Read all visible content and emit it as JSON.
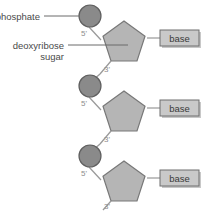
{
  "figure": {
    "background_color": "#ffffff",
    "width": 207,
    "height": 211
  },
  "colors": {
    "phosphate_fill": "#8a8a8a",
    "phosphate_stroke": "#5f5f5f",
    "sugar_fill": "#b5b5b5",
    "sugar_stroke": "#787878",
    "base_fill": "#c9c9c9",
    "base_stroke": "#6e6e6e",
    "base_shadow": "#9a9a9a",
    "bond_stroke": "#9a9a9a",
    "leader_stroke": "#6b6b6b",
    "callout_text": "#4a4a4a",
    "prime_text": "#8d8d8d",
    "base_text": "#3a3a3a"
  },
  "callouts": [
    {
      "id": "phosphate",
      "label": "phosphate",
      "text_x": 38,
      "text_y": 19,
      "anchor": "end",
      "line": {
        "x1": 43,
        "y1": 16,
        "x2": 78,
        "y2": 16
      }
    },
    {
      "id": "deoxyribose-sugar",
      "label_line1": "deoxyribose",
      "label_line2": "sugar",
      "text_x": 62,
      "text_y1": 46,
      "text_y2": 57,
      "anchor": "end",
      "line": {
        "x1": 67,
        "y1": 45,
        "x2": 127,
        "y2": 45
      }
    }
  ],
  "units": [
    {
      "id": "nucleotide-1",
      "phosphate": {
        "cx": 90,
        "cy": 16,
        "r": 11
      },
      "bond_to_sugar": {
        "x1": 90,
        "y1": 27,
        "x2": 99,
        "y2": 37
      },
      "sugar": {
        "cx": 124,
        "cy": 44,
        "r": 23,
        "rotation": 0
      },
      "label_5prime": {
        "text": "5'",
        "x": 84,
        "y": 35
      },
      "label_3prime": {
        "text": "3'",
        "x": 106,
        "y": 72
      },
      "bond_3prime": {
        "x1": 111,
        "y1": 64,
        "x2": 101,
        "y2": 74
      },
      "base": {
        "label": "base",
        "x": 160,
        "y": 30,
        "width": 39,
        "height": 16
      },
      "base_link": {
        "x1": 147,
        "y1": 38,
        "x2": 160,
        "y2": 38
      }
    },
    {
      "id": "nucleotide-2",
      "phosphate": {
        "cx": 90,
        "cy": 86,
        "r": 11
      },
      "bond_to_sugar": {
        "x1": 90,
        "y1": 97,
        "x2": 99,
        "y2": 107
      },
      "sugar": {
        "cx": 124,
        "cy": 114,
        "r": 23,
        "rotation": 0
      },
      "label_5prime": {
        "text": "5'",
        "x": 84,
        "y": 105
      },
      "label_3prime": {
        "text": "3'",
        "x": 106,
        "y": 142
      },
      "bond_3prime": {
        "x1": 111,
        "y1": 134,
        "x2": 101,
        "y2": 144
      },
      "base": {
        "label": "base",
        "x": 160,
        "y": 100,
        "width": 39,
        "height": 16
      },
      "base_link": {
        "x1": 147,
        "y1": 108,
        "x2": 160,
        "y2": 108
      }
    },
    {
      "id": "nucleotide-3",
      "phosphate": {
        "cx": 90,
        "cy": 156,
        "r": 11
      },
      "bond_to_sugar": {
        "x1": 90,
        "y1": 167,
        "x2": 99,
        "y2": 177
      },
      "sugar": {
        "cx": 124,
        "cy": 184,
        "r": 23,
        "rotation": 0
      },
      "label_5prime": {
        "text": "5'",
        "x": 84,
        "y": 175
      },
      "label_3prime": {
        "text": "3'",
        "x": 106,
        "y": 212
      },
      "bond_3prime": {
        "x1": 111,
        "y1": 204,
        "x2": 101,
        "y2": 214
      },
      "base": {
        "label": "base",
        "x": 160,
        "y": 170,
        "width": 39,
        "height": 16
      },
      "base_link": {
        "x1": 147,
        "y1": 178,
        "x2": 160,
        "y2": 178
      }
    }
  ],
  "interunit_bonds": [
    {
      "id": "bond-1-to-2",
      "x1": 101,
      "y1": 74,
      "x2": 93,
      "y2": 80
    },
    {
      "id": "bond-2-to-3",
      "x1": 101,
      "y1": 144,
      "x2": 93,
      "y2": 150
    }
  ]
}
